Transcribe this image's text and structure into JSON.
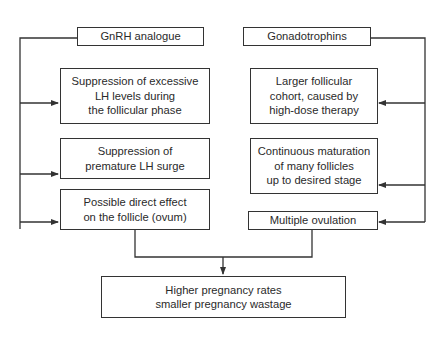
{
  "diagram": {
    "sources": {
      "left": {
        "label": "GnRH analogue"
      },
      "right": {
        "label": "Gonadotrophins"
      }
    },
    "left_effects": [
      {
        "label": "Suppression of excessive\nLH levels during\nthe follicular phase"
      },
      {
        "label": "Suppression of\npremature LH surge"
      },
      {
        "label": "Possible direct effect\non the follicle (ovum)"
      }
    ],
    "right_effects": [
      {
        "label": "Larger follicular\ncohort, caused by\nhigh-dose therapy"
      },
      {
        "label": "Continuous maturation\nof many follicles\nup to desired stage"
      },
      {
        "label": "Multiple ovulation"
      }
    ],
    "outcome": {
      "label": "Higher pregnancy rates\nsmaller pregnancy wastage"
    },
    "colors": {
      "stroke": "#333333",
      "text": "#2a2a2a",
      "background": "#ffffff"
    }
  }
}
